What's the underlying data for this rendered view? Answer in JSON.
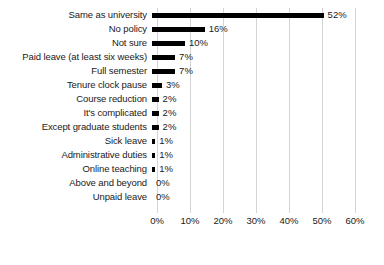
{
  "chart_data": {
    "type": "bar",
    "orientation": "horizontal",
    "title": "",
    "subtitle": "",
    "xlabel": "",
    "ylabel": "",
    "xlim": [
      0,
      60
    ],
    "xtick_values": [
      0,
      10,
      20,
      30,
      40,
      50,
      60
    ],
    "xtick_labels": [
      "0%",
      "10%",
      "20%",
      "30%",
      "40%",
      "50%",
      "60%"
    ],
    "grid": true,
    "grid_axis": "x",
    "legend": false,
    "legend_position": "none",
    "bar_color": "#000000",
    "grid_color": "#d4d4d4",
    "background_color": "#ffffff",
    "text_color": "#1a1a1a",
    "value_label_suffix": "%",
    "categories": [
      "Same as university",
      "No policy",
      "Not sure",
      "Paid leave (at least six weeks)",
      "Full semester",
      "Tenure clock pause",
      "Course reduction",
      "It's complicated",
      "Except graduate students",
      "Sick leave",
      "Administrative duties",
      "Online teaching",
      "Above and beyond",
      "Unpaid leave"
    ],
    "values": [
      52,
      16,
      10,
      7,
      7,
      3,
      2,
      2,
      2,
      1,
      1,
      1,
      0,
      0
    ],
    "value_labels": [
      "52%",
      "16%",
      "10%",
      "7%",
      "7%",
      "3%",
      "2%",
      "2%",
      "2%",
      "1%",
      "1%",
      "1%",
      "0%",
      "0%"
    ]
  }
}
